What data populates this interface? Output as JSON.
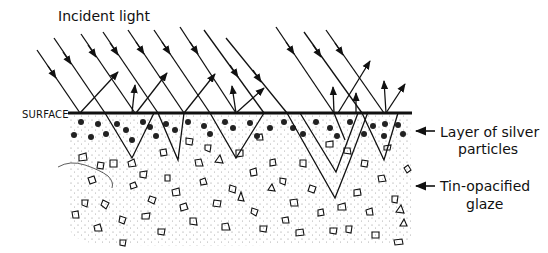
{
  "diagram": {
    "title_label": "Incident light",
    "surface_label": "SURFACE",
    "right_labels": [
      {
        "line1": "Layer of silver",
        "line2": "particles"
      },
      {
        "line1": "Tin-opacified",
        "line2": "glaze"
      }
    ],
    "colors": {
      "ink": "#111111",
      "background": "#ffffff",
      "stipple": "#888888"
    },
    "incident_ray_count": 12,
    "surface_y": 113,
    "surface_x_range": [
      68,
      412
    ]
  }
}
